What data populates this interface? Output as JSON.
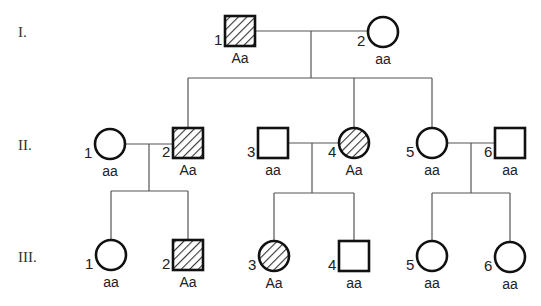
{
  "diagram": {
    "type": "pedigree",
    "colors": {
      "line": "#555555",
      "symbol_stroke": "#111111",
      "hatch": "#333333",
      "background": "#ffffff"
    },
    "generations": [
      {
        "label": "I.",
        "y": 32
      },
      {
        "label": "II.",
        "y": 145
      },
      {
        "label": "III.",
        "y": 257
      }
    ],
    "individuals": [
      {
        "id": "I-1",
        "gen": 0,
        "num": "1",
        "sex": "male",
        "affected": true,
        "genotype": "Aa",
        "cx": 240,
        "cy": 31
      },
      {
        "id": "I-2",
        "gen": 0,
        "num": "2",
        "sex": "female",
        "affected": false,
        "genotype": "aa",
        "cx": 383,
        "cy": 32
      },
      {
        "id": "II-1",
        "gen": 1,
        "num": "1",
        "sex": "female",
        "affected": false,
        "genotype": "aa",
        "cx": 110,
        "cy": 144
      },
      {
        "id": "II-2",
        "gen": 1,
        "num": "2",
        "sex": "male",
        "affected": true,
        "genotype": "Aa",
        "cx": 188,
        "cy": 143
      },
      {
        "id": "II-3",
        "gen": 1,
        "num": "3",
        "sex": "male",
        "affected": false,
        "genotype": "aa",
        "cx": 273,
        "cy": 143
      },
      {
        "id": "II-4",
        "gen": 1,
        "num": "4",
        "sex": "female",
        "affected": true,
        "genotype": "Aa",
        "cx": 354,
        "cy": 143
      },
      {
        "id": "II-5",
        "gen": 1,
        "num": "5",
        "sex": "female",
        "affected": false,
        "genotype": "aa",
        "cx": 432,
        "cy": 143
      },
      {
        "id": "II-6",
        "gen": 1,
        "num": "6",
        "sex": "male",
        "affected": false,
        "genotype": "aa",
        "cx": 510,
        "cy": 143
      },
      {
        "id": "III-1",
        "gen": 2,
        "num": "1",
        "sex": "female",
        "affected": false,
        "genotype": "aa",
        "cx": 111,
        "cy": 255
      },
      {
        "id": "III-2",
        "gen": 2,
        "num": "2",
        "sex": "male",
        "affected": true,
        "genotype": "Aa",
        "cx": 188,
        "cy": 255
      },
      {
        "id": "III-3",
        "gen": 2,
        "num": "3",
        "sex": "female",
        "affected": true,
        "genotype": "Aa",
        "cx": 274,
        "cy": 256
      },
      {
        "id": "III-4",
        "gen": 2,
        "num": "4",
        "sex": "male",
        "affected": false,
        "genotype": "aa",
        "cx": 354,
        "cy": 256
      },
      {
        "id": "III-5",
        "gen": 2,
        "num": "5",
        "sex": "female",
        "affected": false,
        "genotype": "aa",
        "cx": 432,
        "cy": 256
      },
      {
        "id": "III-6",
        "gen": 2,
        "num": "6",
        "sex": "female",
        "affected": false,
        "genotype": "aa",
        "cx": 510,
        "cy": 257
      }
    ],
    "matings": [
      {
        "partners": [
          "I-1",
          "I-2"
        ],
        "y": 31,
        "drop_x": 311,
        "sib_y": 78,
        "children": [
          "II-2",
          "II-4",
          "II-5"
        ]
      },
      {
        "partners": [
          "II-1",
          "II-2"
        ],
        "y": 144,
        "drop_x": 149,
        "sib_y": 191,
        "children": [
          "III-1",
          "III-2"
        ]
      },
      {
        "partners": [
          "II-3",
          "II-4"
        ],
        "y": 143,
        "drop_x": 312,
        "sib_y": 193,
        "children": [
          "III-3",
          "III-4"
        ]
      },
      {
        "partners": [
          "II-5",
          "II-6"
        ],
        "y": 143,
        "drop_x": 471,
        "sib_y": 193,
        "children": [
          "III-5",
          "III-6"
        ]
      }
    ]
  }
}
